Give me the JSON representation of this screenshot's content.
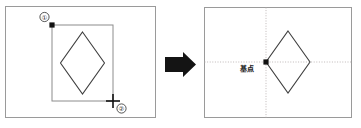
{
  "figure": {
    "title": "",
    "background_color": "#ffffff",
    "width": 361,
    "height": 128
  },
  "left_panel": {
    "name": "before-state",
    "frame": {
      "x": 5,
      "y": 6,
      "width": 151,
      "height": 112,
      "stroke_color": "#9a9a9a"
    },
    "selection_rectangle": {
      "label": "selection-window",
      "x": 52,
      "y": 25,
      "width": 61,
      "height": 76,
      "stroke_color": "#8c8c8c"
    },
    "shape": {
      "name": "diamond",
      "stroke_color": "#3a3a3a",
      "center_x": 82.5,
      "center_y": 63,
      "half_width": 22,
      "half_height": 31
    },
    "markers": [
      {
        "name": "point-1",
        "type": "dot",
        "x": 52,
        "y": 25,
        "callout": "①",
        "callout_x": 44,
        "callout_y": 17,
        "color": "#111111"
      },
      {
        "name": "point-2",
        "type": "crosshair",
        "x": 113,
        "y": 101,
        "callout": "②",
        "callout_x": 121,
        "callout_y": 109,
        "color": "#111111"
      }
    ]
  },
  "arrow": {
    "name": "transform-arrow",
    "color": "#141414",
    "x": 165,
    "y": 52,
    "width": 31,
    "height": 25,
    "direction": "right"
  },
  "right_panel": {
    "name": "after-state",
    "frame": {
      "x": 204,
      "y": 7,
      "width": 148,
      "height": 111,
      "stroke_color": "#9a9a9a"
    },
    "crosshair_guides": {
      "name": "reference-axes",
      "vertical_x": 266,
      "horizontal_y": 62,
      "stroke_color": "#b8b0b0",
      "dash": "1,1.6"
    },
    "base_point": {
      "name": "base-point-marker",
      "x": 266,
      "y": 62,
      "color": "#111111",
      "label": "基点",
      "label_x": 247,
      "label_y": 70
    },
    "shape": {
      "name": "diamond",
      "stroke_color": "#3a3a3a",
      "left_vertex_x": 266,
      "left_vertex_y": 62,
      "width": 44,
      "height": 62
    }
  },
  "legend": {
    "step_1": "①",
    "step_2": "②",
    "base_point_label": "基点"
  }
}
